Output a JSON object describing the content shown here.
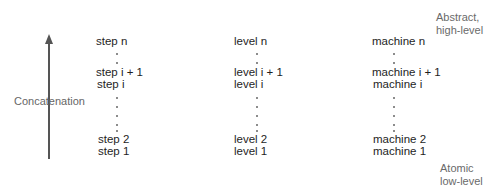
{
  "arrow": {
    "label": "Concatenation",
    "direction": "up"
  },
  "side_labels": {
    "top": [
      "Abstract,",
      "high-level"
    ],
    "bottom": [
      "Atomic",
      "low-level"
    ]
  },
  "columns": [
    {
      "name": "step",
      "rows": {
        "n": "step n",
        "i_plus_1": "step i + 1",
        "i": "step i",
        "two": "step 2",
        "one": "step 1"
      }
    },
    {
      "name": "level",
      "rows": {
        "n": "level n",
        "i_plus_1": "level i + 1",
        "i": "level i",
        "two": "level 2",
        "one": "level 1"
      }
    },
    {
      "name": "machine",
      "rows": {
        "n": "machine n",
        "i_plus_1": "machine i + 1",
        "i": "machine i",
        "two": "machine 2",
        "one": "machine 1"
      }
    }
  ]
}
